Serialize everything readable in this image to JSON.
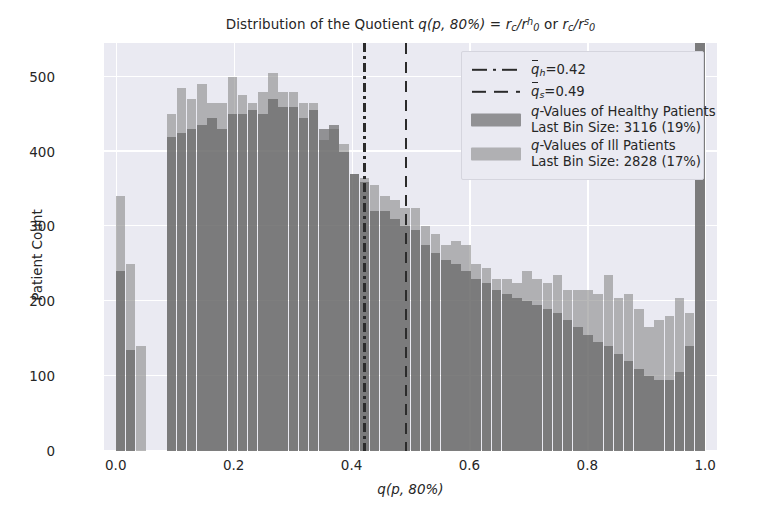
{
  "chart_data": {
    "type": "bar",
    "title_plain": "Distribution of the Quotient",
    "xlabel": "q(p, 80%)",
    "ylabel": "Patient Count",
    "xlim": [
      -0.02,
      1.02
    ],
    "ylim": [
      0,
      545
    ],
    "xticks": [
      "0.0",
      "0.2",
      "0.4",
      "0.6",
      "0.8",
      "1.0"
    ],
    "xtick_values": [
      0.0,
      0.2,
      0.4,
      0.6,
      0.8,
      1.0
    ],
    "yticks": [
      "0",
      "100",
      "200",
      "300",
      "400",
      "500"
    ],
    "ytick_values": [
      0,
      100,
      200,
      300,
      400,
      500
    ],
    "grid": true,
    "grid_color": "#ffffff",
    "plot_background": "#eaeaf2",
    "legend_position": "upper right",
    "bin_count": 58,
    "bin_width": 0.01724,
    "bin_starts": [
      0.0,
      0.0172,
      0.0345,
      0.0517,
      0.069,
      0.0862,
      0.1034,
      0.1207,
      0.1379,
      0.1552,
      0.1724,
      0.1897,
      0.2069,
      0.2241,
      0.2414,
      0.2586,
      0.2759,
      0.2931,
      0.3103,
      0.3276,
      0.3448,
      0.3621,
      0.3793,
      0.3966,
      0.4138,
      0.431,
      0.4483,
      0.4655,
      0.4828,
      0.5,
      0.5172,
      0.5345,
      0.5517,
      0.569,
      0.5862,
      0.6034,
      0.6207,
      0.6379,
      0.6552,
      0.6724,
      0.6897,
      0.7069,
      0.7241,
      0.7414,
      0.7586,
      0.7759,
      0.7931,
      0.8103,
      0.8276,
      0.8448,
      0.862,
      0.8793,
      0.8966,
      0.9138,
      0.931,
      0.9483,
      0.9655,
      0.9828
    ],
    "series": [
      {
        "name": "q-Values of Healthy Patients",
        "color": "#5a5a5a",
        "alpha": 0.62,
        "last_bin_size": 3116,
        "last_bin_percent": "19%",
        "mean_marker": 0.42,
        "values": [
          240,
          135,
          0,
          0,
          0,
          420,
          425,
          430,
          435,
          445,
          430,
          450,
          450,
          455,
          450,
          470,
          460,
          460,
          445,
          455,
          430,
          435,
          400,
          370,
          360,
          320,
          320,
          310,
          300,
          295,
          275,
          265,
          255,
          250,
          240,
          230,
          225,
          215,
          210,
          205,
          200,
          195,
          190,
          185,
          175,
          165,
          155,
          145,
          140,
          130,
          120,
          110,
          100,
          95,
          95,
          105,
          140,
          545
        ]
      },
      {
        "name": "q-Values of Ill Patients",
        "color": "#8c8c8c",
        "alpha": 0.62,
        "last_bin_size": 2828,
        "last_bin_percent": "17%",
        "mean_marker": 0.49,
        "values": [
          340,
          250,
          140,
          0,
          0,
          450,
          485,
          470,
          490,
          465,
          465,
          500,
          475,
          465,
          480,
          505,
          480,
          480,
          465,
          465,
          415,
          430,
          410,
          370,
          365,
          355,
          340,
          335,
          325,
          325,
          300,
          290,
          275,
          280,
          275,
          250,
          245,
          230,
          230,
          225,
          240,
          230,
          225,
          235,
          215,
          215,
          215,
          210,
          235,
          205,
          210,
          190,
          165,
          175,
          180,
          205,
          185,
          545
        ]
      }
    ],
    "vlines": [
      {
        "name": "q_h_mean",
        "label": "q̄_h=0.42",
        "value": 0.42,
        "style": "dashdot",
        "color": "#2b2b2b"
      },
      {
        "name": "q_s_mean",
        "label": "q̄_s=0.49",
        "value": 0.49,
        "style": "dashed",
        "color": "#2b2b2b"
      }
    ]
  },
  "title": {
    "prefix": "Distribution of the Quotient ",
    "q": "q",
    "args": "(p, 80%)",
    "eq": " = ",
    "r1_base": "r",
    "r1_sub": "c",
    "slash": "/",
    "r0_base": "r",
    "r0_sub": "0",
    "r0_sup_h": "h",
    "or": " or ",
    "r0_sup_s": "s"
  },
  "axes": {
    "ylabel": "Patient Count",
    "xlabel_q": "q",
    "xlabel_args": "(p, 80%)",
    "yticks": [
      "0",
      "100",
      "200",
      "300",
      "400",
      "500"
    ],
    "xticks": [
      "0.0",
      "0.2",
      "0.4",
      "0.6",
      "0.8",
      "1.0"
    ]
  },
  "legend": {
    "entries": [
      {
        "kind": "line",
        "style": "dashdot",
        "base": "q",
        "sub": "h",
        "rest": "=0.42"
      },
      {
        "kind": "line",
        "style": "dashed",
        "base": "q",
        "sub": "s",
        "rest": "=0.49"
      },
      {
        "kind": "patch",
        "series": "healthy",
        "italic": "q",
        "main": "-Values of Healthy Patients",
        "sub": "Last Bin Size: 3116 (19%)"
      },
      {
        "kind": "patch",
        "series": "ill",
        "italic": "q",
        "main": "-Values of Ill Patients",
        "sub": "Last Bin Size: 2828 (17%)"
      }
    ]
  }
}
